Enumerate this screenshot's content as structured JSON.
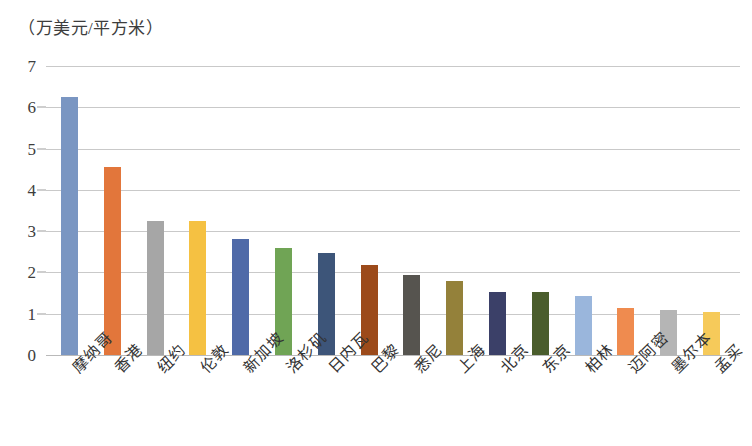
{
  "chart_data": {
    "type": "bar",
    "title": "（万美元/平方米）",
    "subtitle": "",
    "xlabel": "",
    "ylabel": "（万美元/平方米）",
    "ylim": [
      0,
      7
    ],
    "yticks": [
      0,
      1,
      2,
      3,
      4,
      5,
      6,
      7
    ],
    "ytick_labels": [
      "0",
      "1",
      "2",
      "3",
      "4",
      "5",
      "6",
      "7"
    ],
    "grid": true,
    "legend": false,
    "legend_position": "none",
    "categories": [
      "摩纳哥",
      "香港",
      "纽约",
      "伦敦",
      "新加坡",
      "洛杉矶",
      "日内瓦",
      "巴黎",
      "悉尼",
      "上海",
      "北京",
      "东京",
      "柏林",
      "迈阿密",
      "墨尔本",
      "孟买"
    ],
    "values": [
      6.25,
      4.55,
      3.25,
      3.25,
      2.8,
      2.58,
      2.47,
      2.18,
      1.95,
      1.8,
      1.53,
      1.52,
      1.42,
      1.15,
      1.08,
      1.05
    ],
    "colors": [
      "#7a96c2",
      "#e2763b",
      "#a6a6a6",
      "#f5c142",
      "#4f6aa8",
      "#70a455",
      "#3d5579",
      "#9c4a1a",
      "#56544f",
      "#94813a",
      "#3b4068",
      "#4a5d2c",
      "#9ab6dc",
      "#ef8b4f",
      "#b5b5b5",
      "#f6ca5a"
    ]
  }
}
